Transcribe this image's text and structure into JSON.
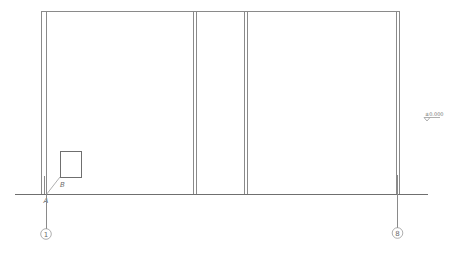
{
  "drawing": {
    "type": "building elevation drawing",
    "top_beam": {
      "x1": 41,
      "x2": 400,
      "y": 11
    },
    "ground_line": {
      "x1": 15,
      "x2": 428,
      "y": 194
    },
    "columns": [
      {
        "name": "column-left",
        "x_outer": 41,
        "x_inner": 46
      },
      {
        "name": "column-mid-left",
        "x_outer": 193,
        "x_inner": 196
      },
      {
        "name": "column-mid-right",
        "x_outer": 244,
        "x_inner": 247
      },
      {
        "name": "column-right",
        "x_outer": 396,
        "x_inner": 399
      }
    ],
    "detail_box": {
      "x": 60,
      "y": 151,
      "width": 21,
      "height": 26
    },
    "point_labels": {
      "a": "A",
      "b": "B"
    },
    "axis_bubbles": [
      {
        "label": "1",
        "cx": 46,
        "cy": 234
      },
      {
        "label": "8",
        "cx": 397,
        "cy": 233
      }
    ],
    "elevation_marker": {
      "text": "±0.000",
      "x": 424,
      "y": 116
    },
    "colors": {
      "line": "#8a8a8a",
      "text": "#6a6a6a",
      "background": "#ffffff"
    }
  }
}
